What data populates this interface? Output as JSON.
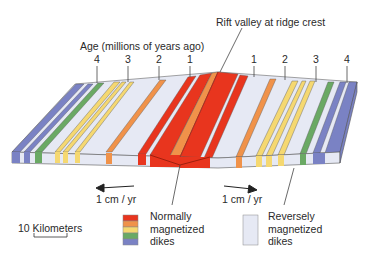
{
  "title_rift": "Rift valley at ridge crest",
  "axis_title": "Age (millions of years ago)",
  "ticks_left": [
    "4",
    "3",
    "2",
    "1"
  ],
  "ticks_right": [
    "1",
    "2",
    "3",
    "4"
  ],
  "rate_left": "1 cm / yr",
  "rate_right": "1 cm / yr",
  "scale_label": "10 Kilometers",
  "legend": {
    "normal": {
      "line1": "Normally",
      "line2": "magnetized",
      "line3": "dikes"
    },
    "reverse": {
      "line1": "Reversely",
      "line2": "magnetized",
      "line3": "dikes"
    }
  },
  "colors": {
    "red": "#e8351e",
    "orange": "#f0924a",
    "yellow": "#f5d871",
    "green": "#6aa964",
    "blue": "#7a82c4",
    "reverse": "#e6e9f4"
  }
}
